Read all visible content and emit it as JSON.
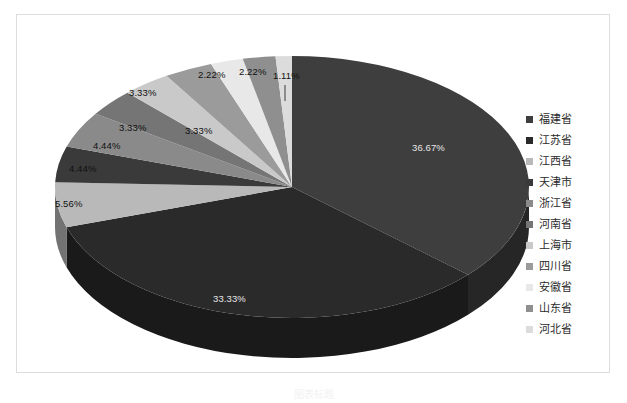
{
  "chart_data": {
    "type": "pie",
    "title": "",
    "subtitle": "",
    "xlabel": "",
    "ylabel": "",
    "legend_position": "right",
    "grid": false,
    "three_d": true,
    "value_suffix": "%",
    "categories": [
      "福建省",
      "江苏省",
      "江西省",
      "天津市",
      "浙江省",
      "河南省",
      "上海市",
      "四川省",
      "安徽省",
      "山东省",
      "河北省"
    ],
    "values": [
      36.67,
      33.33,
      5.56,
      4.44,
      4.44,
      3.33,
      3.33,
      3.33,
      2.22,
      2.22,
      1.11
    ],
    "labels": [
      "36.67%",
      "33.33%",
      "5.56%",
      "4.44%",
      "4.44%",
      "3.33%",
      "3.33%",
      "3.33%",
      "2.22%",
      "2.22%",
      "1.11%"
    ],
    "colors": [
      "#3e3e3e",
      "#2a2a2a",
      "#b9b9b9",
      "#3a3a3a",
      "#8a8a8a",
      "#757575",
      "#c9c9c9",
      "#9b9b9b",
      "#e8e8e8",
      "#8f8f8f",
      "#dcdcdc"
    ],
    "slices": [
      {
        "name": "福建省",
        "value": 36.67,
        "label": "36.67%",
        "color": "#3e3e3e"
      },
      {
        "name": "江苏省",
        "value": 33.33,
        "label": "33.33%",
        "color": "#2a2a2a"
      },
      {
        "name": "江西省",
        "value": 5.56,
        "label": "5.56%",
        "color": "#b9b9b9"
      },
      {
        "name": "天津市",
        "value": 4.44,
        "label": "4.44%",
        "color": "#3a3a3a"
      },
      {
        "name": "浙江省",
        "value": 4.44,
        "label": "4.44%",
        "color": "#8a8a8a"
      },
      {
        "name": "河南省",
        "value": 3.33,
        "label": "3.33%",
        "color": "#757575"
      },
      {
        "name": "上海市",
        "value": 3.33,
        "label": "3.33%",
        "color": "#c9c9c9"
      },
      {
        "name": "四川省",
        "value": 3.33,
        "label": "3.33%",
        "color": "#9b9b9b"
      },
      {
        "name": "安徽省",
        "value": 2.22,
        "label": "2.22%",
        "color": "#e8e8e8"
      },
      {
        "name": "山东省",
        "value": 2.22,
        "label": "2.22%",
        "color": "#8f8f8f"
      },
      {
        "name": "河北省",
        "value": 1.11,
        "label": "1.11%",
        "color": "#dcdcdc"
      }
    ]
  },
  "legend": {
    "items": [
      {
        "label": "福建省",
        "color": "#3e3e3e"
      },
      {
        "label": "江苏省",
        "color": "#2a2a2a"
      },
      {
        "label": "江西省",
        "color": "#b9b9b9"
      },
      {
        "label": "天津市",
        "color": "#3a3a3a"
      },
      {
        "label": "浙江省",
        "color": "#8a8a8a"
      },
      {
        "label": "河南省",
        "color": "#757575"
      },
      {
        "label": "上海市",
        "color": "#c9c9c9"
      },
      {
        "label": "四川省",
        "color": "#9b9b9b"
      },
      {
        "label": "安徽省",
        "color": "#e8e8e8"
      },
      {
        "label": "山东省",
        "color": "#8f8f8f"
      },
      {
        "label": "河北省",
        "color": "#dcdcdc"
      }
    ]
  },
  "caption": {
    "text": "图表标题"
  }
}
